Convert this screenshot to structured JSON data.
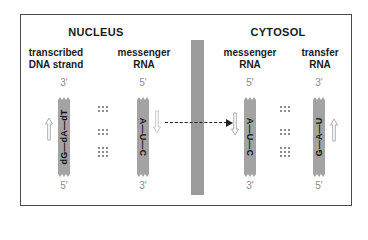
{
  "diagram": {
    "compartments": {
      "nucleus": {
        "title": "NUCLEUS"
      },
      "cytosol": {
        "title": "CYTOSOL"
      }
    },
    "columns": [
      {
        "id": "dna",
        "label_line1": "transcribed",
        "label_line2": "DNA strand",
        "top_end": "3′",
        "bottom_end": "5′",
        "sequence": "dG—dA—dT",
        "reading_direction": "up"
      },
      {
        "id": "mrna-nucleus",
        "label_line1": "messenger",
        "label_line2": "RNA",
        "top_end": "5′",
        "bottom_end": "3′",
        "sequence": "A—U—C",
        "reading_direction": "down"
      },
      {
        "id": "mrna-cytosol",
        "label_line1": "messenger",
        "label_line2": "RNA",
        "top_end": "5′",
        "bottom_end": "3′",
        "sequence": "A—U—C",
        "reading_direction": "down"
      },
      {
        "id": "trna",
        "label_line1": "transfer",
        "label_line2": "RNA",
        "top_end": "3′",
        "bottom_end": "5′",
        "sequence": "G—A—U",
        "reading_direction": "up"
      }
    ],
    "base_pair_bonds": {
      "nucleus": [
        "⋮⋮⋮\n⋮⋮⋮",
        "⋮⋮⋮\n⋮⋮⋮",
        "⋮⋮⋮\n⋮⋮⋮\n⋮⋮⋮"
      ],
      "cytosol": [
        "⋮⋮⋮\n⋮⋮⋮",
        "⋮⋮⋮\n⋮⋮⋮",
        "⋮⋮⋮\n⋮⋮⋮\n⋮⋮⋮"
      ],
      "bond_counts": [
        2,
        2,
        3
      ]
    },
    "export_arrow": {
      "from": "mrna-nucleus",
      "to": "mrna-cytosol",
      "style": "dashed"
    },
    "colors": {
      "strand": "#a3a3a3",
      "divider": "#9b9b9b",
      "frame": "#4a4a4a",
      "prime_label": "#8a8a8a"
    }
  }
}
